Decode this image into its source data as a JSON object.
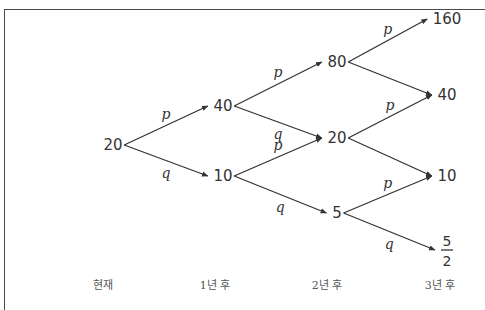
{
  "diagram": {
    "type": "probability-tree",
    "nodes": [
      {
        "id": "n0",
        "label": "20",
        "stage": 0
      },
      {
        "id": "n1a",
        "label": "40",
        "stage": 1
      },
      {
        "id": "n1b",
        "label": "10",
        "stage": 1
      },
      {
        "id": "n2a",
        "label": "80",
        "stage": 2
      },
      {
        "id": "n2b",
        "label": "20",
        "stage": 2
      },
      {
        "id": "n2c",
        "label": "5",
        "stage": 2
      },
      {
        "id": "n3a",
        "label": "160",
        "stage": 3
      },
      {
        "id": "n3b",
        "label": "40",
        "stage": 3
      },
      {
        "id": "n3c",
        "label": "10",
        "stage": 3
      },
      {
        "id": "n3d",
        "label": "5/2",
        "numerator": "5",
        "denominator": "2",
        "stage": 3
      }
    ],
    "edges": [
      {
        "from": "n0",
        "to": "n1a",
        "label": "p"
      },
      {
        "from": "n0",
        "to": "n1b",
        "label": "q"
      },
      {
        "from": "n1a",
        "to": "n2a",
        "label": "p"
      },
      {
        "from": "n1a",
        "to": "n2b",
        "label": "q"
      },
      {
        "from": "n1b",
        "to": "n2b",
        "label": "p"
      },
      {
        "from": "n1b",
        "to": "n2c",
        "label": "q"
      },
      {
        "from": "n2a",
        "to": "n3a",
        "label": "p"
      },
      {
        "from": "n2a",
        "to": "n3b",
        "label": ""
      },
      {
        "from": "n2b",
        "to": "n3b",
        "label": "p"
      },
      {
        "from": "n2b",
        "to": "n3c",
        "label": ""
      },
      {
        "from": "n2c",
        "to": "n3c",
        "label": "p"
      },
      {
        "from": "n2c",
        "to": "n3d",
        "label": "q"
      }
    ],
    "stages": [
      "현재",
      "1년 후",
      "2년 후",
      "3년 후"
    ]
  }
}
